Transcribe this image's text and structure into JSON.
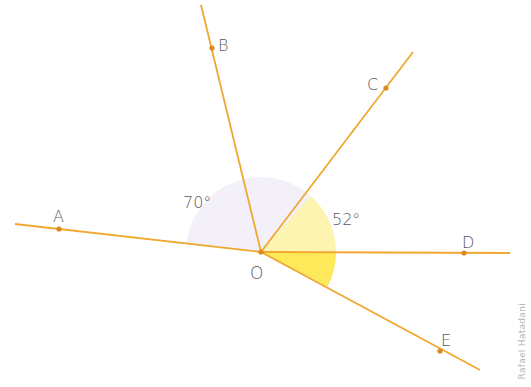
{
  "diagram": {
    "type": "geometry-angles",
    "vertex": {
      "label": "O",
      "x": 261,
      "y": 252
    },
    "rays": [
      {
        "label": "A",
        "end": [
          15,
          224
        ],
        "dot": [
          59,
          229
        ],
        "label_pos": [
          53,
          222
        ]
      },
      {
        "label": "B",
        "end": [
          201,
          5
        ],
        "dot": [
          212,
          48
        ],
        "label_pos": [
          218,
          50
        ]
      },
      {
        "label": "C",
        "end": [
          413,
          52
        ],
        "dot": [
          386,
          88
        ],
        "label_pos": [
          367,
          90
        ]
      },
      {
        "label": "D",
        "end": [
          510,
          253
        ],
        "dot": [
          464,
          253
        ],
        "label_pos": [
          462,
          247
        ]
      },
      {
        "label": "E",
        "end": [
          480,
          370
        ],
        "dot": [
          440,
          351
        ],
        "label_pos": [
          441,
          346
        ]
      }
    ],
    "angles": [
      {
        "label": "70°",
        "between": [
          "A",
          "B"
        ],
        "label_pos": [
          183,
          208
        ]
      },
      {
        "label": "52°",
        "between": [
          "C",
          "D"
        ],
        "label_pos": [
          332,
          225
        ]
      }
    ],
    "vertex_label_pos": [
      250,
      278
    ],
    "colors": {
      "line": "#f0a830",
      "dot": "#d98a1e",
      "sector_lavender": "#f4f0fa",
      "sector_pale_yellow": "#fdf6b8",
      "sector_yellow": "#fde95a",
      "text": "#5a5a5e"
    }
  },
  "credit": "Rafael Hatadani"
}
